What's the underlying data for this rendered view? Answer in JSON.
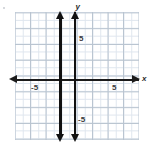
{
  "figure": {
    "name": "coordinate-plane-graph",
    "background_color": "#ffffff",
    "grid": {
      "minor_color": "#dfe6ee",
      "major_color": "#b9c4d0",
      "minor_step_units": 1,
      "major_step_units": 2,
      "visible": true
    },
    "axes": {
      "color": "#1b1b1b",
      "x": {
        "label": "x",
        "arrow_left": true,
        "arrow_right": true,
        "tick_labels": [
          "-5",
          "5"
        ],
        "tick_values": [
          -5,
          5
        ],
        "range": [
          -8,
          8
        ]
      },
      "y": {
        "label": "y",
        "arrow_top": false,
        "arrow_bottom": false,
        "tick_labels": [
          "5",
          "-5"
        ],
        "tick_values": [
          5,
          -5
        ],
        "range": [
          -8,
          8
        ]
      }
    }
  },
  "chart_data": {
    "type": "line",
    "title": "",
    "xlabel": "x",
    "ylabel": "y",
    "xlim": [
      -8,
      8
    ],
    "ylim": [
      -8,
      8
    ],
    "grid": true,
    "legend": "none",
    "x_tick_labels": [
      "-5",
      "5"
    ],
    "y_tick_labels": [
      "5",
      "-5"
    ],
    "series": [
      {
        "name": "vertical-line-left",
        "equation": "x = -2",
        "type": "vertical-line",
        "x": -2,
        "color": "#111111",
        "arrow_top": true,
        "arrow_bottom": true
      },
      {
        "name": "vertical-line-right",
        "equation": "x = 0",
        "type": "vertical-line",
        "x": 0,
        "color": "#111111",
        "arrow_top": true,
        "arrow_bottom": true
      }
    ]
  }
}
